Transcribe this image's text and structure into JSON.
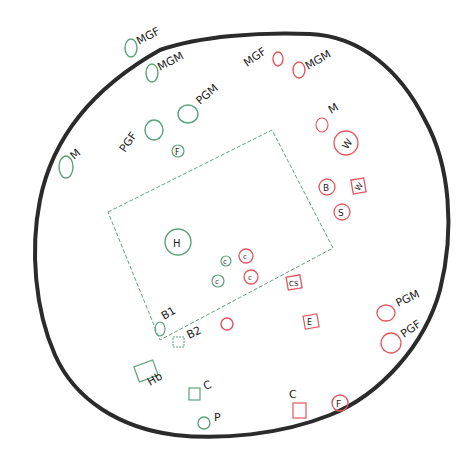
{
  "colors": {
    "outline": "#2b2b2b",
    "green": "#5aa37a",
    "red": "#e4575f",
    "text": "#222222"
  },
  "boundary": {
    "label": ""
  },
  "house": {
    "label": "H"
  },
  "green_nodes": [
    {
      "id": "g-mgf",
      "shape": "circle",
      "label": "MGF",
      "inner": ""
    },
    {
      "id": "g-mgm",
      "shape": "circle",
      "label": "MGM",
      "inner": ""
    },
    {
      "id": "g-pgm",
      "shape": "circle",
      "label": "PGM",
      "inner": ""
    },
    {
      "id": "g-pgf",
      "shape": "circle",
      "label": "PGF",
      "inner": ""
    },
    {
      "id": "g-m",
      "shape": "circle",
      "label": "M",
      "inner": ""
    },
    {
      "id": "g-f",
      "shape": "circle",
      "label": "",
      "inner": "F"
    },
    {
      "id": "g-c1",
      "shape": "circle",
      "label": "",
      "inner": "c"
    },
    {
      "id": "g-c2",
      "shape": "circle",
      "label": "",
      "inner": "c"
    },
    {
      "id": "g-b1",
      "shape": "circle",
      "label": "B1",
      "inner": ""
    },
    {
      "id": "g-b2",
      "shape": "square",
      "label": "B2",
      "inner": ""
    },
    {
      "id": "g-hb",
      "shape": "square",
      "label": "Hb",
      "inner": ""
    },
    {
      "id": "g-c",
      "shape": "square",
      "label": "C",
      "inner": ""
    },
    {
      "id": "g-p",
      "shape": "circle",
      "label": "P",
      "inner": ""
    }
  ],
  "red_nodes": [
    {
      "id": "r-mgf",
      "shape": "circle",
      "label": "MGF",
      "inner": ""
    },
    {
      "id": "r-mgm",
      "shape": "circle",
      "label": "MGM",
      "inner": ""
    },
    {
      "id": "r-m",
      "shape": "circle",
      "label": "M",
      "inner": ""
    },
    {
      "id": "r-w-circle",
      "shape": "circle",
      "label": "",
      "inner": "W"
    },
    {
      "id": "r-b",
      "shape": "circle",
      "label": "",
      "inner": "B"
    },
    {
      "id": "r-w-square",
      "shape": "square",
      "label": "",
      "inner": "W"
    },
    {
      "id": "r-s",
      "shape": "circle",
      "label": "",
      "inner": "S"
    },
    {
      "id": "r-c1",
      "shape": "circle",
      "label": "",
      "inner": "c"
    },
    {
      "id": "r-c2",
      "shape": "circle",
      "label": "",
      "inner": "c"
    },
    {
      "id": "r-cs",
      "shape": "square",
      "label": "",
      "inner": "CS"
    },
    {
      "id": "r-unlabeled",
      "shape": "circle",
      "label": "",
      "inner": ""
    },
    {
      "id": "r-e",
      "shape": "square",
      "label": "",
      "inner": "E"
    },
    {
      "id": "r-pgm",
      "shape": "circle",
      "label": "PGM",
      "inner": ""
    },
    {
      "id": "r-pgf",
      "shape": "circle",
      "label": "PGF",
      "inner": ""
    },
    {
      "id": "r-c",
      "shape": "square",
      "label": "C",
      "inner": ""
    },
    {
      "id": "r-f",
      "shape": "circle",
      "label": "",
      "inner": "F"
    }
  ]
}
